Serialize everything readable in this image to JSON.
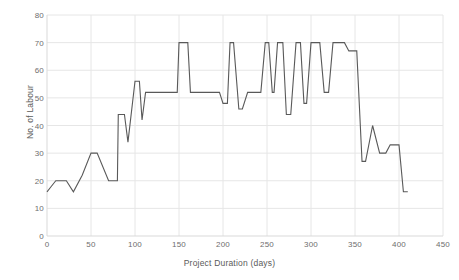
{
  "chart_data": {
    "type": "line",
    "title": "",
    "subtitle": "",
    "xlabel": "Project Duration (days)",
    "ylabel": "No. of Labour",
    "xlim": [
      0,
      450
    ],
    "ylim": [
      0,
      80
    ],
    "xticks": [
      0,
      50,
      100,
      150,
      200,
      250,
      300,
      350,
      400,
      450
    ],
    "yticks": [
      0,
      10,
      20,
      30,
      40,
      50,
      60,
      70,
      80
    ],
    "grid": true,
    "legend": null,
    "legend_position": "none",
    "annotations": [],
    "line_color": "#595959",
    "grid_color": "#e6e6e6",
    "axis_color": "#d9d9d9",
    "series": [
      {
        "name": "No. of Labour",
        "x": [
          0,
          5,
          10,
          22,
          30,
          40,
          50,
          57,
          70,
          72,
          80,
          81,
          88,
          92,
          100,
          105,
          108,
          112,
          118,
          122,
          130,
          140,
          148,
          150,
          152,
          160,
          163,
          170,
          175,
          196,
          200,
          205,
          208,
          210,
          212,
          218,
          222,
          228,
          232,
          237,
          243,
          248,
          252,
          256,
          258,
          262,
          268,
          272,
          277,
          283,
          288,
          292,
          295,
          300,
          305,
          310,
          315,
          320,
          325,
          330,
          338,
          343,
          350,
          352,
          358,
          362,
          370,
          378,
          385,
          390,
          395,
          400,
          405,
          410
        ],
        "y": [
          16,
          18,
          20,
          20,
          16,
          22,
          30,
          30,
          20,
          20,
          20,
          44,
          44,
          34,
          56,
          56,
          42,
          52,
          52,
          52,
          52,
          52,
          52,
          70,
          70,
          70,
          52,
          52,
          52,
          52,
          48,
          48,
          70,
          70,
          70,
          46,
          46,
          52,
          52,
          52,
          52,
          70,
          70,
          52,
          52,
          70,
          70,
          44,
          44,
          70,
          70,
          48,
          48,
          70,
          70,
          70,
          52,
          52,
          70,
          70,
          70,
          67,
          67,
          67,
          27,
          27,
          40,
          30,
          30,
          33,
          33,
          33,
          16,
          16
        ]
      }
    ]
  }
}
